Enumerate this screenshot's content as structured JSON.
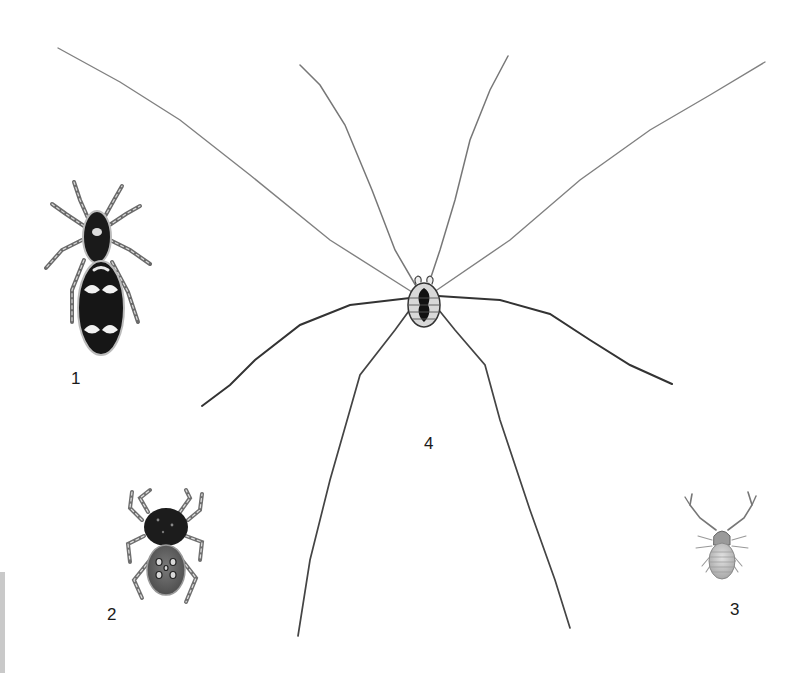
{
  "plate": {
    "background": "#ffffff",
    "specimens": [
      {
        "id": 1,
        "label": "1",
        "subject": "jumping spider with black-and-white banded abdomen",
        "label_pos": [
          74,
          372
        ]
      },
      {
        "id": 2,
        "label": "2",
        "subject": "jumping spider with dark cephalothorax and spotted gray abdomen",
        "label_pos": [
          110,
          608
        ]
      },
      {
        "id": 3,
        "label": "3",
        "subject": "pseudoscorpion",
        "label_pos": [
          733,
          603
        ]
      },
      {
        "id": 4,
        "label": "4",
        "subject": "harvestman (daddy long-legs)",
        "label_pos": [
          427,
          437
        ]
      }
    ],
    "edge_bar_color": "#c9c9c9",
    "ink_color": "#2b2b2b"
  }
}
